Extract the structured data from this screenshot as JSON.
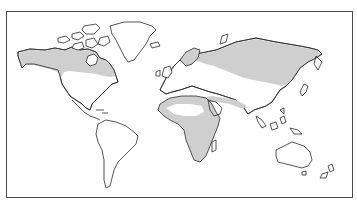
{
  "map": {
    "type": "world-outline-map",
    "projection": "equirectangular-style",
    "style": "black line art on white with gray shaded regions",
    "colors": {
      "background": "#ffffff",
      "outline": "#2a2a2a",
      "shaded_region": "#cfcfcf",
      "frame": "#4a4a4a"
    },
    "legend": null,
    "title": null,
    "shaded_regions": [
      {
        "name": "northern-north-america",
        "description": "Alaska and northern Canada band"
      },
      {
        "name": "northern-eurasia",
        "description": "Scandinavia through Siberia band"
      },
      {
        "name": "africa-middle-east",
        "description": "Africa (except Sahara interior) and band through Middle East into Central Asia"
      }
    ],
    "unshaded_regions": [
      "Greenland",
      "Southern North America",
      "Central America",
      "South America",
      "Western and Central Europe",
      "Sahara interior",
      "South and East Asia",
      "Southeast Asia",
      "Australia",
      "New Zealand"
    ]
  }
}
